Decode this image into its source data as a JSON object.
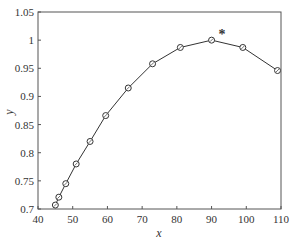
{
  "chart_data": {
    "type": "line",
    "title": "",
    "xlabel": "x",
    "ylabel": "y",
    "xlim": [
      40,
      110
    ],
    "ylim": [
      0.7,
      1.05
    ],
    "xticks": [
      40,
      50,
      60,
      70,
      80,
      90,
      100,
      110
    ],
    "yticks": [
      0.7,
      0.75,
      0.8,
      0.85,
      0.9,
      0.95,
      1,
      1.05
    ],
    "xtick_labels": [
      "40",
      "50",
      "60",
      "70",
      "80",
      "90",
      "100",
      "110"
    ],
    "ytick_labels": [
      "0.7",
      "0.75",
      "0.8",
      "0.85",
      "0.9",
      "0.95",
      "1",
      "1.05"
    ],
    "grid": false,
    "legend": null,
    "series": [
      {
        "name": "curve",
        "marker": "circle-open",
        "x": [
          45,
          46,
          48,
          51,
          55,
          59.5,
          66,
          73,
          81,
          90,
          99,
          109
        ],
        "y": [
          0.707,
          0.721,
          0.745,
          0.78,
          0.82,
          0.866,
          0.915,
          0.958,
          0.987,
          1.0,
          0.987,
          0.946
        ]
      },
      {
        "name": "optimum",
        "marker": "star",
        "x": [
          93
        ],
        "y": [
          1.012
        ]
      }
    ],
    "annotations": [
      {
        "text": "*",
        "x": 93,
        "y": 1.012
      }
    ]
  },
  "colors": {
    "line": "#333333",
    "axis": "#555555",
    "background": "#ffffff"
  }
}
